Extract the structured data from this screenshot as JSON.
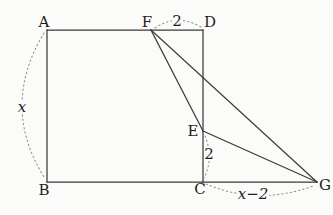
{
  "figure": {
    "canvas": {
      "width": 333,
      "height": 215,
      "background": "#fbfbf9"
    },
    "style": {
      "line_color": "#3b3b3b",
      "line_width": 1.25,
      "dash_color": "#96968f",
      "dash_width": 1.1,
      "label_color": "#1e1e1e",
      "font_size": 15
    },
    "points": {
      "A": {
        "x": 47,
        "y": 30
      },
      "B": {
        "x": 47,
        "y": 182
      },
      "C": {
        "x": 203,
        "y": 182
      },
      "D": {
        "x": 203,
        "y": 30
      },
      "E": {
        "x": 203,
        "y": 131
      },
      "F": {
        "x": 151,
        "y": 30
      },
      "G": {
        "x": 317,
        "y": 182
      }
    },
    "edges": [
      {
        "name": "segment-AD",
        "from": "A",
        "to": "D"
      },
      {
        "name": "segment-AB",
        "from": "A",
        "to": "B"
      },
      {
        "name": "segment-BG",
        "from": "B",
        "to": "G"
      },
      {
        "name": "segment-DC",
        "from": "D",
        "to": "C"
      },
      {
        "name": "segment-FE",
        "from": "F",
        "to": "E"
      },
      {
        "name": "segment-FG",
        "from": "F",
        "to": "G"
      },
      {
        "name": "segment-EG",
        "from": "E",
        "to": "G"
      }
    ],
    "arcs": [
      {
        "name": "dim-arc-AB",
        "d": "M 44 33 Q 0 106 44 177"
      },
      {
        "name": "dim-arc-FD",
        "d": "M 155 28 Q 177 13 201 27"
      },
      {
        "name": "dim-arc-EC",
        "d": "M 205 136 Q 214 158 204 178"
      },
      {
        "name": "dim-arc-CG",
        "d": "M 206 184 Q 258 206 313 186"
      }
    ],
    "labels": [
      {
        "name": "vertex-label-A",
        "text": "A",
        "x": 44,
        "y": 27,
        "italic": false,
        "bg": false,
        "bgw": 0
      },
      {
        "name": "vertex-label-B",
        "text": "B",
        "x": 44,
        "y": 195,
        "italic": false,
        "bg": false,
        "bgw": 0
      },
      {
        "name": "vertex-label-C",
        "text": "C",
        "x": 200,
        "y": 194,
        "italic": false,
        "bg": false,
        "bgw": 0
      },
      {
        "name": "vertex-label-D",
        "text": "D",
        "x": 210,
        "y": 27,
        "italic": false,
        "bg": false,
        "bgw": 0
      },
      {
        "name": "vertex-label-E",
        "text": "E",
        "x": 193,
        "y": 136,
        "italic": false,
        "bg": false,
        "bgw": 0
      },
      {
        "name": "vertex-label-F",
        "text": "F",
        "x": 147,
        "y": 27,
        "italic": false,
        "bg": false,
        "bgw": 0
      },
      {
        "name": "vertex-label-G",
        "text": "G",
        "x": 325,
        "y": 190,
        "italic": false,
        "bg": false,
        "bgw": 0
      },
      {
        "name": "dim-label-x",
        "text": "x",
        "x": 22,
        "y": 112,
        "italic": true,
        "bg": true,
        "bgw": 12
      },
      {
        "name": "dim-label-FD-2",
        "text": "2",
        "x": 177,
        "y": 26,
        "italic": false,
        "bg": true,
        "bgw": 9
      },
      {
        "name": "dim-label-EC-2",
        "text": "2",
        "x": 209,
        "y": 159,
        "italic": false,
        "bg": true,
        "bgw": 9
      },
      {
        "name": "dim-label-CG",
        "text": "x−2",
        "x": 253,
        "y": 199,
        "italic": true,
        "bg": true,
        "bgw": 32
      }
    ]
  }
}
